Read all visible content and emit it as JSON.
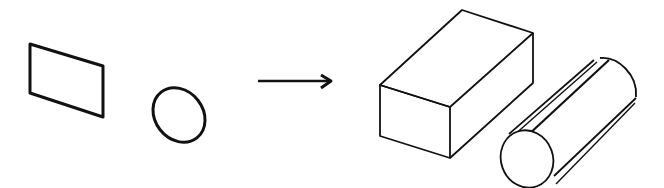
{
  "diagram": {
    "stroke_color": "#111111",
    "background": "#ffffff",
    "inputs": [
      {
        "shape": "rectangle",
        "view": "2D"
      },
      {
        "shape": "ellipse",
        "view": "2D"
      }
    ],
    "connector": {
      "type": "arrow",
      "direction": "right"
    },
    "outputs": [
      {
        "shape": "rectangular-prism",
        "view": "3D"
      },
      {
        "shape": "cylinder",
        "view": "3D"
      }
    ]
  }
}
